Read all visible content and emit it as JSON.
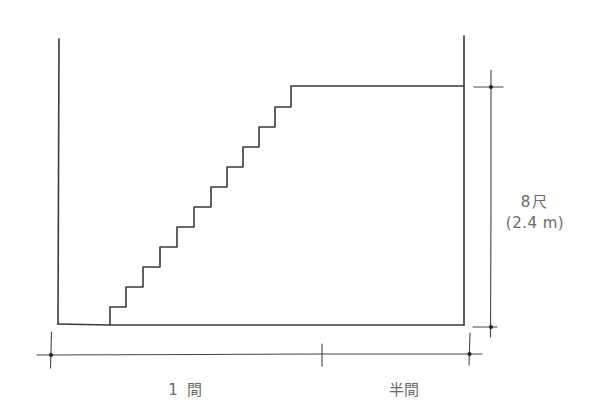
{
  "diagram": {
    "type": "staircase-section",
    "colors": {
      "line": "#3a3a3a",
      "text": "#6a6a6a",
      "background": "#ffffff"
    },
    "labels": {
      "height_shaku": "8尺",
      "height_metric": "(2.4 m)",
      "width_main": "1 間",
      "width_half": "半間"
    },
    "stairs": {
      "risers_x": [
        110,
        126,
        143,
        160,
        177,
        194,
        211,
        227,
        243,
        259,
        275,
        291
      ],
      "treads_y": [
        307,
        287,
        267,
        247,
        227,
        207,
        187,
        167,
        147,
        127,
        107,
        86
      ],
      "floor_y": 325,
      "landing_end_x": 464
    }
  }
}
